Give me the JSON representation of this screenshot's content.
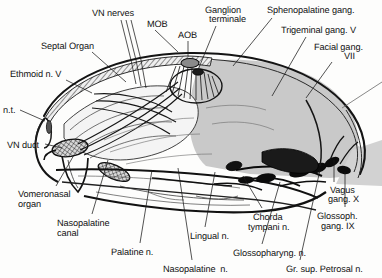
{
  "figure": {
    "background_color": "#fdfdfc",
    "ink_color": "#111111",
    "shade_color": "#c9c9c9",
    "line_color": "#1a1a1a"
  },
  "labels": [
    {
      "id": "vn-nerves",
      "text": "VN nerves",
      "x": 92,
      "y": 8,
      "align": "left"
    },
    {
      "id": "mob",
      "text": "MOB",
      "x": 147,
      "y": 19,
      "align": "left"
    },
    {
      "id": "aob",
      "text": "AOB",
      "x": 178,
      "y": 30,
      "align": "left"
    },
    {
      "id": "ganglion-terminale-1",
      "text": "Ganglion",
      "x": 205,
      "y": 5,
      "align": "left"
    },
    {
      "id": "ganglion-terminale-2",
      "text": "terminale",
      "x": 209,
      "y": 14,
      "align": "left"
    },
    {
      "id": "sphenopalatine-gang",
      "text": "Sphenopalatine gang.",
      "x": 267,
      "y": 5,
      "align": "left"
    },
    {
      "id": "trigeminal-gang",
      "text": "Trigeminal gang. V",
      "x": 281,
      "y": 25,
      "align": "left"
    },
    {
      "id": "facial-gang-1",
      "text": "Facial gang.",
      "x": 314,
      "y": 42,
      "align": "left"
    },
    {
      "id": "facial-gang-2",
      "text": "VII",
      "x": 344,
      "y": 51,
      "align": "left"
    },
    {
      "id": "septal-organ",
      "text": "Septal Organ",
      "x": 41,
      "y": 41,
      "align": "left"
    },
    {
      "id": "ethmoid-n-v",
      "text": "Ethmoid n. V",
      "x": 10,
      "y": 69,
      "align": "left"
    },
    {
      "id": "n-t",
      "text": "n.t.",
      "x": 3,
      "y": 105,
      "align": "left"
    },
    {
      "id": "vn-duct",
      "text": "VN duct",
      "x": 7,
      "y": 140,
      "align": "left"
    },
    {
      "id": "vomeronasal-organ-1",
      "text": "Vomeronasal",
      "x": 18,
      "y": 189,
      "align": "left"
    },
    {
      "id": "vomeronasal-organ-2",
      "text": "organ",
      "x": 18,
      "y": 199,
      "align": "left"
    },
    {
      "id": "nasopalatine-canal-1",
      "text": "Nasopalatine",
      "x": 57,
      "y": 218,
      "align": "left"
    },
    {
      "id": "nasopalatine-canal-2",
      "text": "canal",
      "x": 57,
      "y": 228,
      "align": "left"
    },
    {
      "id": "palatine-n",
      "text": "Palatine n.",
      "x": 111,
      "y": 247,
      "align": "left"
    },
    {
      "id": "nasopalatine-n",
      "text": "Nasopalatine  n.",
      "x": 163,
      "y": 264,
      "align": "left"
    },
    {
      "id": "lingual-n",
      "text": "Lingual n.",
      "x": 190,
      "y": 231,
      "align": "left"
    },
    {
      "id": "chorda-tympani-n-1",
      "text": "Chorda",
      "x": 253,
      "y": 212,
      "align": "left"
    },
    {
      "id": "chorda-tympani-n-2",
      "text": "tympani n.",
      "x": 248,
      "y": 222,
      "align": "left"
    },
    {
      "id": "glossopharyng-n",
      "text": "Glossopharyng. n.",
      "x": 233,
      "y": 248,
      "align": "left"
    },
    {
      "id": "gr-sup-petrosal-n",
      "text": "Gr. sup. Petrosal n.",
      "x": 286,
      "y": 264,
      "align": "left"
    },
    {
      "id": "vagus-gang-1",
      "text": "Vagus",
      "x": 330,
      "y": 185,
      "align": "left"
    },
    {
      "id": "vagus-gang-2",
      "text": "gang. X",
      "x": 328,
      "y": 194,
      "align": "left"
    },
    {
      "id": "glossoph-gang-1",
      "text": "Glossoph.",
      "x": 317,
      "y": 211,
      "align": "left"
    },
    {
      "id": "glossoph-gang-2",
      "text": "gang. IX",
      "x": 321,
      "y": 221,
      "align": "left"
    }
  ],
  "leader_lines": [
    {
      "id": "vn-nerves-a",
      "points": "121,20 131,60 136,84"
    },
    {
      "id": "vn-nerves-b",
      "points": "126,20 136,60 141,86"
    },
    {
      "id": "vn-nerves-c",
      "points": "131,20 141,60 146,88"
    },
    {
      "id": "mob-leader",
      "points": "155,30 178,52"
    },
    {
      "id": "aob-leader",
      "points": "188,41 188,56"
    },
    {
      "id": "ganglion-leader",
      "points": "216,26 198,70"
    },
    {
      "id": "spheno-leader",
      "points": "272,18 233,66"
    },
    {
      "id": "trigeminal-leader",
      "points": "306,37 272,96"
    },
    {
      "id": "facial-leader",
      "points": "332,62 306,98"
    },
    {
      "id": "septal-leader",
      "points": "92,52 126,82"
    },
    {
      "id": "ethmoid-leader",
      "points": "66,80 92,93"
    },
    {
      "id": "nt-leader",
      "points": "20,110 45,121"
    },
    {
      "id": "vnduct-leader",
      "points": "45,144 62,148"
    },
    {
      "id": "vomeronasal-leader",
      "points": "56,186 74,155"
    },
    {
      "id": "nasocanal-leader",
      "points": "92,214 108,160"
    },
    {
      "id": "palatine-leader",
      "points": "140,243 152,170"
    },
    {
      "id": "nasopal-n-leader",
      "points": "192,260 178,168"
    },
    {
      "id": "lingual-leader",
      "points": "205,227 215,172"
    },
    {
      "id": "chorda-leader",
      "points": "262,208 243,176"
    },
    {
      "id": "glossoph-n-leader",
      "points": "262,244 280,182"
    },
    {
      "id": "petrosal-leader",
      "points": "300,260 320,170"
    },
    {
      "id": "vagus-leader",
      "points": "334,182 334,160"
    },
    {
      "id": "glossoph-g-leader",
      "points": "345,207 345,172"
    }
  ]
}
